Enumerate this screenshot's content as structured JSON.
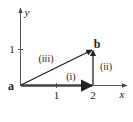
{
  "diagram": {
    "axes": {
      "x_label": "x",
      "y_label": "y",
      "x_ticks": [
        {
          "value": 1,
          "label": "1"
        },
        {
          "value": 2,
          "label": "2"
        }
      ],
      "y_ticks": [
        {
          "value": 1,
          "label": "1"
        }
      ]
    },
    "points": {
      "a": {
        "label": "a",
        "coords": [
          0,
          0
        ]
      },
      "b": {
        "label": "b",
        "coords": [
          2,
          1
        ]
      }
    },
    "vectors": [
      {
        "id": "i",
        "label": "(i)",
        "from": [
          0,
          0
        ],
        "to": [
          2,
          0
        ]
      },
      {
        "id": "ii",
        "label": "(ii)",
        "from": [
          2,
          0
        ],
        "to": [
          2,
          1
        ]
      },
      {
        "id": "iii",
        "label": "(iii)",
        "from": [
          0,
          0
        ],
        "to": [
          2,
          1
        ]
      }
    ],
    "colors": {
      "axis": "#555555",
      "vector": "#222222",
      "vector_i": "#444444"
    }
  }
}
